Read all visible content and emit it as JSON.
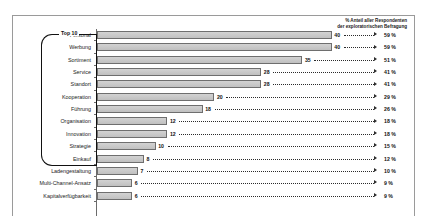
{
  "clipped_title": "· ·",
  "legend": {
    "line1": "% Anteil aller Respondenten",
    "line2": "der exploratorischen Befragung"
  },
  "bracket": {
    "label": "Top 10"
  },
  "colors": {
    "bar_fill": "#c8c8c8",
    "bar_border": "#6e6e6e",
    "frame": "#9a9a9a",
    "text": "#111111"
  },
  "chart_data": {
    "type": "bar",
    "orientation": "horizontal",
    "title": "",
    "subtitle": "",
    "xlabel": "",
    "ylabel": "",
    "xlim": [
      0,
      44
    ],
    "grid": false,
    "legend_position": "top-right",
    "value_label": "Nennungen",
    "percent_label": "% Anteil aller Respondenten der exploratorischen Befragung",
    "categories": [
      "Personal",
      "Werbung",
      "Sortiment",
      "Service",
      "Standort",
      "Kooperation",
      "Führung",
      "Organisation",
      "Innovation",
      "Strategie",
      "Einkauf",
      "Ladengestaltung",
      "Multi-Channel-Ansatz",
      "Kapitalverfügbarkeit"
    ],
    "values": [
      40,
      40,
      35,
      28,
      28,
      20,
      18,
      12,
      12,
      10,
      8,
      7,
      6,
      6
    ],
    "percents": [
      "59 %",
      "59 %",
      "51 %",
      "41 %",
      "41 %",
      "29 %",
      "26 %",
      "18 %",
      "18 %",
      "15 %",
      "12 %",
      "10 %",
      "9 %",
      "9 %"
    ],
    "top_group_count": 10
  }
}
